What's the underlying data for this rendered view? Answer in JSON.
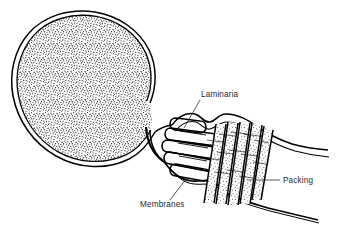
{
  "figure": {
    "domain_note": "black-and-white line drawing, medical illustration",
    "background_color": "#ffffff",
    "ink_color": "#000000",
    "label_color": "#2a2a2a",
    "stipple_color": "#1a1a1a"
  },
  "labels": [
    {
      "id": "laminaria",
      "text": "Laminaria",
      "x": 201,
      "y": 97,
      "anchor": "start",
      "leader": "M 200 100 L 184 128",
      "describes": "cylindrical laminaria tents inserted through the cervical canal"
    },
    {
      "id": "packing",
      "text": "Packing",
      "x": 283,
      "y": 183,
      "anchor": "start",
      "leader": "M 280 180 L 247 180",
      "describes": "gauze packing in the vaginal vault"
    },
    {
      "id": "membranes",
      "text": "Membranes",
      "x": 140,
      "y": 207,
      "anchor": "start",
      "leader": "M 186 179 L 170 200",
      "describes": "fetal membranes forming the wall of the gestational sac"
    }
  ],
  "structures": {
    "sac": {
      "name": "gestational sac",
      "fill_texture": "dense random stipple",
      "wall_style": "double outline"
    },
    "cervical_canal": {
      "name": "cervical canal",
      "contents": "laminaria tents"
    },
    "laminaria_rods": {
      "name": "laminaria tents",
      "count": 5,
      "shape": "rounded-end cylinders"
    },
    "packing_bands": {
      "name": "gauze packing",
      "count": 5,
      "orientation": "diagonal bands"
    },
    "vaginal_walls": {
      "name": "vaginal walls",
      "style": "tapering double lines extending right"
    }
  }
}
